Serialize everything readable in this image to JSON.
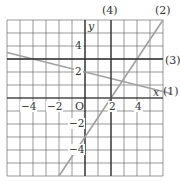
{
  "chart_data": {
    "type": "line",
    "title": "",
    "xlabel": "x",
    "ylabel": "y",
    "origin_label": "O",
    "xlim": [
      -6,
      6
    ],
    "ylim": [
      -6,
      6
    ],
    "grid": true,
    "grid_step": 1,
    "x_ticks": [
      -4,
      -2,
      2,
      4
    ],
    "x_tick_labels": [
      "−4",
      "−2",
      "2",
      "4"
    ],
    "y_ticks": [
      4,
      2,
      -2,
      -4
    ],
    "y_tick_labels": [
      "4",
      "2",
      "−2",
      "−4"
    ],
    "series": [
      {
        "name": "(1)",
        "equation": "y = -x/4 + 2",
        "kind": "line",
        "slope": -0.25,
        "intercept": 2,
        "points": [
          [
            -6,
            3.5
          ],
          [
            6,
            0.5
          ]
        ],
        "color": "#a0a0a0"
      },
      {
        "name": "(2)",
        "equation": "y = 3x/2 - 3",
        "kind": "line",
        "slope": 1.5,
        "intercept": -3,
        "points": [
          [
            -2,
            -6
          ],
          [
            6,
            6
          ]
        ],
        "color": "#a0a0a0"
      },
      {
        "name": "(3)",
        "equation": "y = 3",
        "kind": "horizontal",
        "value": 3,
        "points": [
          [
            -6,
            3
          ],
          [
            6,
            3
          ]
        ],
        "color": "#333333"
      },
      {
        "name": "(4)",
        "equation": "x = 2",
        "kind": "vertical",
        "value": 2,
        "points": [
          [
            2,
            -6
          ],
          [
            2,
            6
          ]
        ],
        "color": "#333333"
      }
    ]
  },
  "labels": {
    "line1": "(1)",
    "line2": "(2)",
    "line3": "(3)",
    "line4": "(4)",
    "x_axis": "x",
    "y_axis": "y",
    "origin": "O",
    "xt_m4": "−4",
    "xt_m2": "−2",
    "xt_2": "2",
    "xt_4": "4",
    "yt_4": "4",
    "yt_2": "2",
    "yt_m2": "−2",
    "yt_m4": "−4"
  }
}
